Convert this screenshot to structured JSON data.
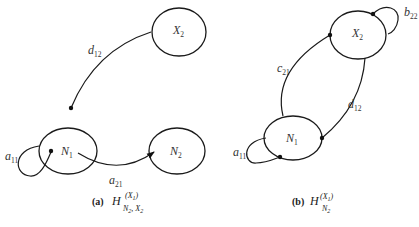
{
  "diagram_a": {
    "caption_label": "(a)",
    "caption_H": "H",
    "caption_sup": "(X",
    "caption_sup_sub": "1",
    "caption_sup_close": ")",
    "caption_sub": "N",
    "caption_sub_sub": "2",
    "caption_sub_rest": ", X",
    "caption_sub_rest_sub": "2",
    "nodes": {
      "x2": {
        "main": "X",
        "sub": "2"
      },
      "n1": {
        "main": "N",
        "sub": "1"
      },
      "n2": {
        "main": "N",
        "sub": "2"
      }
    },
    "edges": {
      "d12": {
        "main": "d",
        "sub": "12"
      },
      "a11": {
        "main": "a",
        "sub": "11"
      },
      "a21": {
        "main": "a",
        "sub": "21"
      }
    }
  },
  "diagram_b": {
    "caption_label": "(b)",
    "caption_H": "H",
    "caption_sup": "(X",
    "caption_sup_sub": "1",
    "caption_sup_close": ")",
    "caption_sub": "N",
    "caption_sub_sub": "2",
    "nodes": {
      "x2": {
        "main": "X",
        "sub": "2"
      },
      "n1": {
        "main": "N",
        "sub": "1"
      }
    },
    "edges": {
      "b22": {
        "main": "b",
        "sub": "22"
      },
      "c21": {
        "main": "c",
        "sub": "21"
      },
      "d12": {
        "main": "d",
        "sub": "12"
      },
      "a11": {
        "main": "a",
        "sub": "11"
      }
    }
  }
}
